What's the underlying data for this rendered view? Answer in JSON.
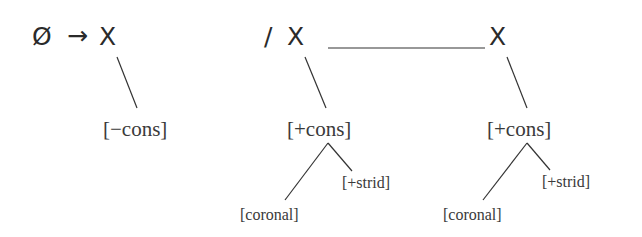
{
  "rule": {
    "lhs": "Ø",
    "arrow": "→",
    "target": "X",
    "target_feature": "[−cons]",
    "environment_slash": "/",
    "left_context": {
      "segment": "X",
      "feature": "[+cons]",
      "daughters": [
        "[coronal]",
        "[+strid]"
      ]
    },
    "focus_blank": "__________",
    "right_context": {
      "segment": "X",
      "feature": "[+cons]",
      "daughters": [
        "[coronal]",
        "[+strid]"
      ]
    }
  },
  "colors": {
    "text": "#2a2a2a",
    "line": "#333333",
    "background": "#ffffff"
  }
}
